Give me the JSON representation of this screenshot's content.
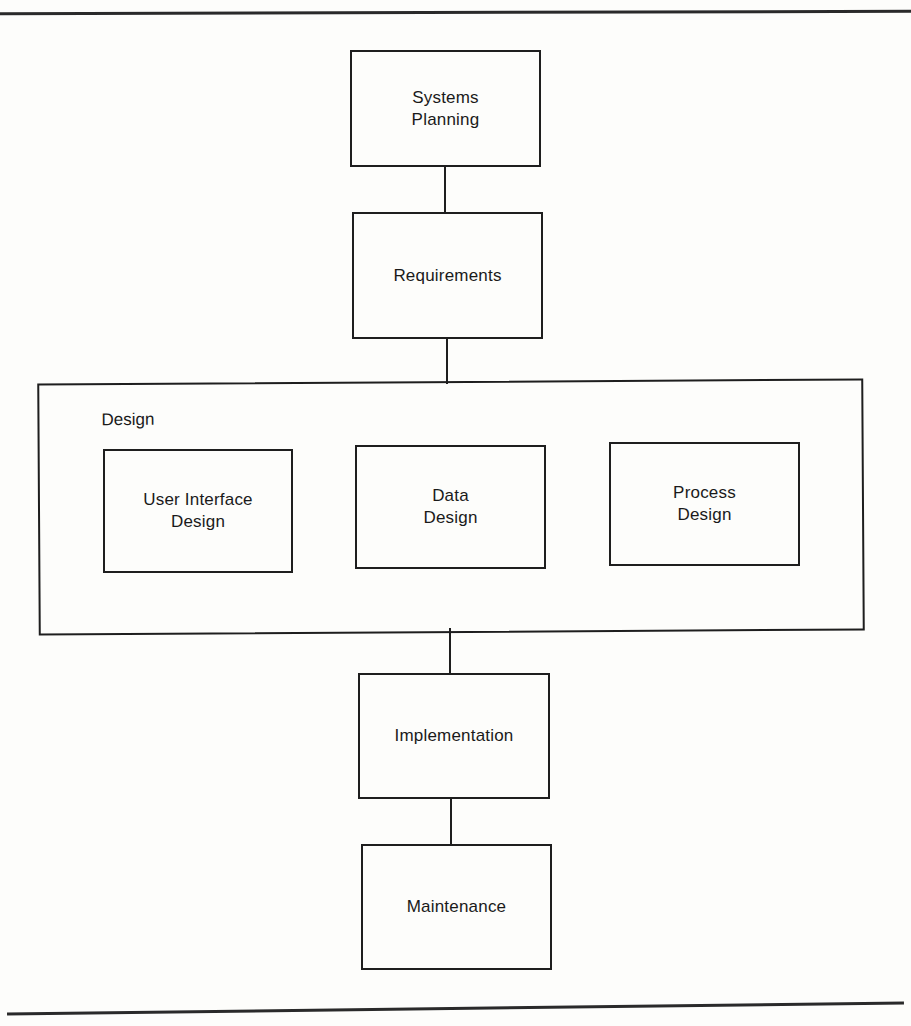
{
  "diagram": {
    "type": "hierarchical process flow",
    "nodes": {
      "systems_planning": "Systems\nPlanning",
      "requirements": "Requirements",
      "design_group": "Design",
      "user_interface_design": "User Interface\nDesign",
      "data_design": "Data\nDesign",
      "process_design": "Process\nDesign",
      "implementation": "Implementation",
      "maintenance": "Maintenance"
    },
    "edges": [
      [
        "Systems Planning",
        "Requirements"
      ],
      [
        "Requirements",
        "Design"
      ],
      [
        "Design",
        "Implementation"
      ],
      [
        "Implementation",
        "Maintenance"
      ]
    ],
    "colors": {
      "stroke": "#1e1e1e",
      "background": "#fdfdfb"
    }
  }
}
